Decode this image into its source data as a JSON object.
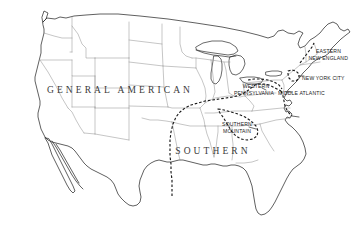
{
  "figure": {
    "background_color": "#ffffff",
    "coastline_color": "#2b2b2b",
    "state_border_color": "#8c8c8c",
    "boundary_color": "#1a1a1a",
    "boundary_style": "dashed"
  },
  "labels": {
    "major": [
      {
        "id": "general-american",
        "text": "GENERAL AMERICAN",
        "x": 120,
        "y": 93
      },
      {
        "id": "southern",
        "text": "SOUTHERN",
        "x": 213,
        "y": 154
      }
    ],
    "minor": [
      {
        "id": "eastern-new-england",
        "line1": "EASTERN",
        "line2": "NEW ENGLAND",
        "x": 322,
        "y": 53
      },
      {
        "id": "new-york-city",
        "line1": "NEW YORK CITY",
        "line2": "",
        "x": 322,
        "y": 79
      },
      {
        "id": "middle-atlantic",
        "line1": "MIDDLE ATLANTIC",
        "line2": "",
        "x": 307,
        "y": 92
      },
      {
        "id": "western-pennsylvania",
        "line1": "WESTERN",
        "line2": "PENNSYLVANIA",
        "x": 255,
        "y": 85
      },
      {
        "id": "southern-mountain",
        "line1": "SOUTHERN",
        "line2": "MOUNTAIN",
        "x": 238,
        "y": 124
      }
    ]
  },
  "legend_note": ""
}
